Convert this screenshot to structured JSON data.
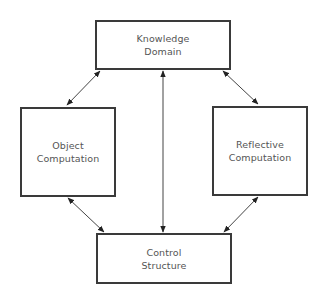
{
  "diagram": {
    "type": "block-diagram",
    "nodes": [
      {
        "id": "knowledge-domain",
        "lines": [
          "Knowledge",
          "Domain"
        ],
        "box": {
          "x": 95,
          "y": 20,
          "w": 136,
          "h": 50
        }
      },
      {
        "id": "object-computation",
        "lines": [
          "Object",
          "Computation"
        ],
        "box": {
          "x": 20,
          "y": 107,
          "w": 96,
          "h": 90
        }
      },
      {
        "id": "reflective-computation",
        "lines": [
          "Reflective",
          "Computation"
        ],
        "box": {
          "x": 212,
          "y": 106,
          "w": 96,
          "h": 90
        }
      },
      {
        "id": "control-structure",
        "lines": [
          "Control",
          "Structure"
        ],
        "box": {
          "x": 96,
          "y": 233,
          "w": 136,
          "h": 51
        }
      }
    ],
    "edges": [
      {
        "from": "knowledge-domain",
        "to": "object-computation",
        "direction": "bidirectional"
      },
      {
        "from": "knowledge-domain",
        "to": "reflective-computation",
        "direction": "bidirectional"
      },
      {
        "from": "object-computation",
        "to": "control-structure",
        "direction": "bidirectional"
      },
      {
        "from": "reflective-computation",
        "to": "control-structure",
        "direction": "bidirectional"
      },
      {
        "from": "knowledge-domain",
        "to": "control-structure",
        "direction": "bidirectional"
      }
    ],
    "colors": {
      "border": "#3a3a3a",
      "text": "#555555",
      "arrow": "#333333",
      "background": "#ffffff"
    }
  }
}
